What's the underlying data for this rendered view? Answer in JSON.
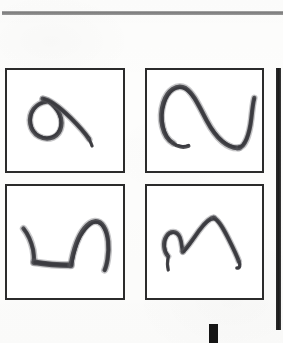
{
  "page": {
    "kind": "scanned-figure",
    "background_color": "#fdfdfc",
    "width": 283,
    "height": 343
  },
  "top_rule": {
    "label": "horizontal-rule",
    "color": "#6f6f6f"
  },
  "right_bar": {
    "label": "page-edge-bar",
    "color": "#1a1a1a"
  },
  "bottom_mark": {
    "label": "black-block-mark",
    "color": "#151515"
  },
  "figure": {
    "caption": "",
    "grid": {
      "rows": 2,
      "columns": 2
    },
    "panels": [
      {
        "id": "panel-0",
        "position": "top-left",
        "label": "",
        "stroke_description": "loop with trailing tail, resembles a numeral nine",
        "ink_color": "#4e4e52"
      },
      {
        "id": "panel-1",
        "position": "top-right",
        "label": "",
        "stroke_description": "tall arch sweeping down to the right then hooking up at the far right",
        "ink_color": "#4e4e52"
      },
      {
        "id": "panel-2",
        "position": "bottom-left",
        "label": "",
        "stroke_description": "short descending stroke, flat horizontal base, then a tall rounded hump",
        "ink_color": "#4e4e52"
      },
      {
        "id": "panel-3",
        "position": "bottom-right",
        "label": "",
        "stroke_description": "small hook, shallow dip, then a large pointed peak descending to a hook",
        "ink_color": "#4e4e52"
      }
    ]
  }
}
